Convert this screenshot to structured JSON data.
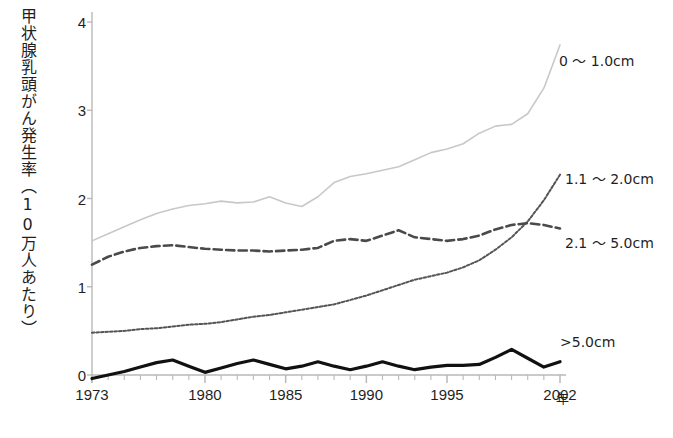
{
  "chart_data": {
    "type": "line",
    "title": "",
    "xlabel": "年",
    "ylabel": "甲状腺乳頭がん発生率（10万人あたり）",
    "xlim": [
      1973,
      2002
    ],
    "ylim": [
      0,
      4
    ],
    "y_ticks": [
      "0",
      "1",
      "2",
      "3",
      "4"
    ],
    "x_ticks": [
      "1973",
      "1980",
      "1985",
      "1990",
      "1995",
      "2002"
    ],
    "x_tick_values": [
      1973,
      1980,
      1985,
      1990,
      1995,
      2002
    ],
    "x_minor_tick_step": 1,
    "grid": false,
    "legend_position": "line-end-labels",
    "x": [
      1973,
      1974,
      1975,
      1976,
      1977,
      1978,
      1979,
      1980,
      1981,
      1982,
      1983,
      1984,
      1985,
      1986,
      1987,
      1988,
      1989,
      1990,
      1991,
      1992,
      1993,
      1994,
      1995,
      1996,
      1997,
      1998,
      1999,
      2000,
      2001,
      2002
    ],
    "series": [
      {
        "name": "0 ～ 1.0cm",
        "label": "0 ～ 1.0cm",
        "style": "solid",
        "color": "#c8c8c8",
        "width": 1.6,
        "values": [
          1.52,
          1.6,
          1.68,
          1.76,
          1.83,
          1.88,
          1.92,
          1.94,
          1.97,
          1.95,
          1.96,
          2.02,
          1.95,
          1.91,
          2.02,
          2.18,
          2.25,
          2.28,
          2.32,
          2.36,
          2.44,
          2.52,
          2.56,
          2.62,
          2.74,
          2.82,
          2.84,
          2.96,
          3.25,
          3.74
        ]
      },
      {
        "name": "1.1 ～ 2.0cm",
        "label": "1.1 ～ 2.0cm",
        "style": "dotted",
        "color": "#555555",
        "width": 2.0,
        "values": [
          0.48,
          0.49,
          0.5,
          0.52,
          0.53,
          0.55,
          0.57,
          0.58,
          0.6,
          0.63,
          0.66,
          0.68,
          0.71,
          0.74,
          0.77,
          0.8,
          0.85,
          0.9,
          0.96,
          1.02,
          1.08,
          1.12,
          1.16,
          1.22,
          1.3,
          1.42,
          1.56,
          1.74,
          1.98,
          2.27
        ]
      },
      {
        "name": "2.1 ～ 5.0cm",
        "label": "2.1 ～ 5.0cm",
        "style": "dashed",
        "color": "#4a4a4a",
        "width": 2.6,
        "values": [
          1.25,
          1.34,
          1.4,
          1.44,
          1.46,
          1.47,
          1.45,
          1.43,
          1.42,
          1.41,
          1.41,
          1.4,
          1.41,
          1.42,
          1.44,
          1.52,
          1.54,
          1.52,
          1.58,
          1.64,
          1.56,
          1.54,
          1.52,
          1.54,
          1.58,
          1.65,
          1.7,
          1.72,
          1.7,
          1.66
        ]
      },
      {
        "name": ">5.0cm",
        "label": ">5.0cm",
        "style": "solid",
        "color": "#111111",
        "width": 3.2,
        "values": [
          -0.04,
          0.0,
          0.04,
          0.09,
          0.14,
          0.17,
          0.1,
          0.03,
          0.08,
          0.13,
          0.17,
          0.12,
          0.07,
          0.1,
          0.15,
          0.1,
          0.06,
          0.1,
          0.15,
          0.1,
          0.06,
          0.09,
          0.11,
          0.11,
          0.12,
          0.2,
          0.29,
          0.19,
          0.09,
          0.15
        ]
      }
    ],
    "series_end_labels": [
      {
        "text": "0 ～ 1.0cm",
        "left": 559,
        "top": 50
      },
      {
        "text": "1.1 ～ 2.0cm",
        "left": 565,
        "top": 168
      },
      {
        "text": "2.1 ～ 5.0cm",
        "left": 565,
        "top": 232
      },
      {
        "text": ">5.0cm",
        "left": 560,
        "top": 334
      }
    ],
    "axis_color": "#b9b9b9"
  }
}
